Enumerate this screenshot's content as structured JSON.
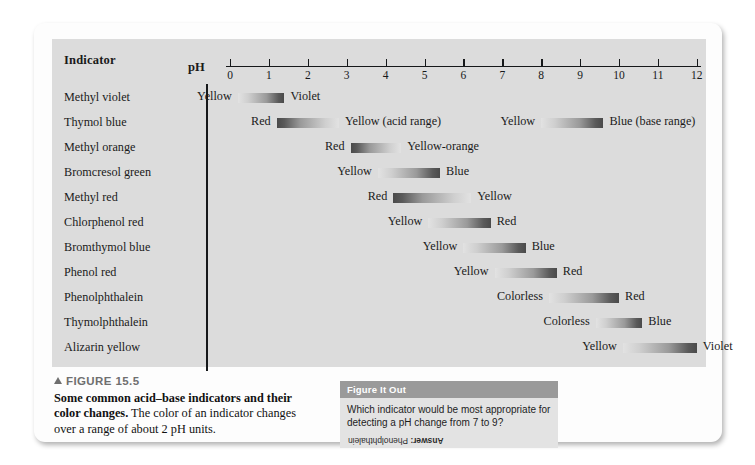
{
  "figure": {
    "tag": "FIGURE 15.5",
    "caption_bold": "Some common acid–base indicators and their color changes.",
    "caption_rest": " The color of an indicator changes over a range of about 2 pH units."
  },
  "table": {
    "indicator_header": "Indicator",
    "ph_label": "pH"
  },
  "figure_it_out": {
    "header": "Figure It Out",
    "question": "Which indicator would be most appropriate for detecting a pH change from 7 to 9?",
    "answer_prefix": "Answer:",
    "answer": " Phenolphthalein"
  },
  "chart_data": {
    "type": "bar",
    "title": "Some common acid–base indicators and their color changes",
    "xlabel": "pH",
    "ylabel": "Indicator",
    "xlim": [
      0,
      12
    ],
    "grid": false,
    "legend": "none",
    "tick_labels": [
      "0",
      "1",
      "2",
      "3",
      "4",
      "5",
      "6",
      "7",
      "8",
      "9",
      "10",
      "11",
      "12"
    ],
    "categories": [
      "Methyl violet",
      "Thymol blue",
      "Methyl orange",
      "Bromcresol green",
      "Methyl red",
      "Chlorphenol red",
      "Bromthymol blue",
      "Phenol red",
      "Phenolphthalein",
      "Thymolphthalein",
      "Alizarin yellow"
    ],
    "bands": [
      {
        "indicator": "Methyl violet",
        "ph_start": 0.2,
        "ph_end": 1.4,
        "acid_color": "Yellow",
        "base_color": "Violet",
        "direction": "light-to-dark"
      },
      {
        "indicator": "Thymol blue",
        "ph_start": 1.2,
        "ph_end": 2.8,
        "acid_color": "Red",
        "base_color": "Yellow (acid range)",
        "direction": "dark-to-light"
      },
      {
        "indicator": "Thymol blue",
        "ph_start": 8.0,
        "ph_end": 9.6,
        "acid_color": "Yellow",
        "base_color": "Blue (base range)",
        "direction": "light-to-dark"
      },
      {
        "indicator": "Methyl orange",
        "ph_start": 3.1,
        "ph_end": 4.4,
        "acid_color": "Red",
        "base_color": "Yellow-orange",
        "direction": "dark-to-light"
      },
      {
        "indicator": "Bromcresol green",
        "ph_start": 3.8,
        "ph_end": 5.4,
        "acid_color": "Yellow",
        "base_color": "Blue",
        "direction": "light-to-dark"
      },
      {
        "indicator": "Methyl red",
        "ph_start": 4.2,
        "ph_end": 6.2,
        "acid_color": "Red",
        "base_color": "Yellow",
        "direction": "dark-to-light"
      },
      {
        "indicator": "Chlorphenol red",
        "ph_start": 5.1,
        "ph_end": 6.7,
        "acid_color": "Yellow",
        "base_color": "Red",
        "direction": "light-to-dark"
      },
      {
        "indicator": "Bromthymol blue",
        "ph_start": 6.0,
        "ph_end": 7.6,
        "acid_color": "Yellow",
        "base_color": "Blue",
        "direction": "light-to-dark"
      },
      {
        "indicator": "Phenol red",
        "ph_start": 6.8,
        "ph_end": 8.4,
        "acid_color": "Yellow",
        "base_color": "Red",
        "direction": "light-to-dark"
      },
      {
        "indicator": "Phenolphthalein",
        "ph_start": 8.2,
        "ph_end": 10.0,
        "acid_color": "Colorless",
        "base_color": "Red",
        "direction": "light-to-dark"
      },
      {
        "indicator": "Thymolphthalein",
        "ph_start": 9.4,
        "ph_end": 10.6,
        "acid_color": "Colorless",
        "base_color": "Blue",
        "direction": "light-to-dark"
      },
      {
        "indicator": "Alizarin yellow",
        "ph_start": 10.1,
        "ph_end": 12.0,
        "acid_color": "Yellow",
        "base_color": "Violet",
        "direction": "light-to-dark"
      }
    ]
  }
}
